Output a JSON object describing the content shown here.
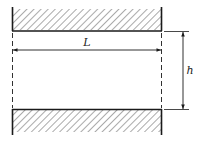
{
  "diagram": {
    "labels": {
      "length": "L",
      "height": "h"
    },
    "colors": {
      "stroke": "#1a1a1a",
      "hatch": "#444444",
      "background": "#ffffff"
    },
    "elements": {
      "top_plate": "hatched wall (top)",
      "bottom_plate": "hatched wall (bottom)",
      "length_dimension": "L",
      "height_dimension": "h"
    }
  }
}
